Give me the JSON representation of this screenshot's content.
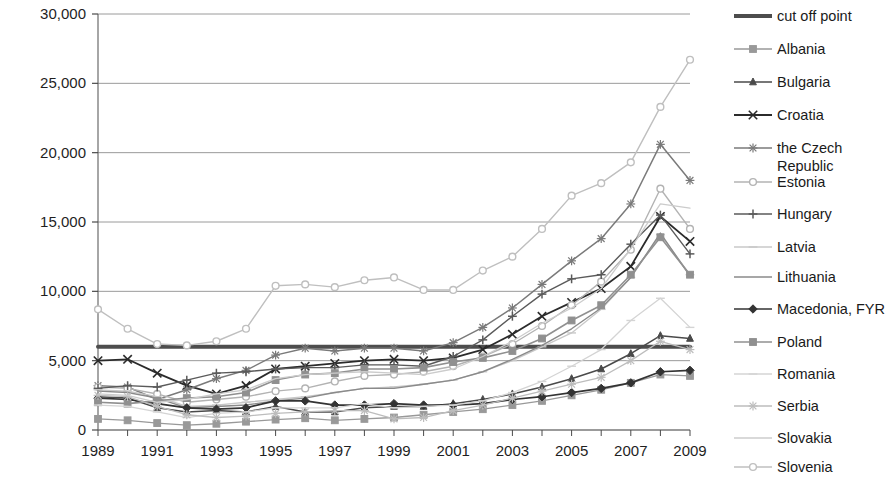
{
  "chart_data": {
    "type": "line",
    "title": "",
    "xlabel": "",
    "ylabel": "",
    "xlim": [
      1989,
      2009
    ],
    "ylim": [
      0,
      30000
    ],
    "ytick_values": [
      0,
      5000,
      10000,
      15000,
      20000,
      25000,
      30000
    ],
    "ytick_labels": [
      "0",
      "5,000",
      "10,000",
      "15,000",
      "20,000",
      "25,000",
      "30,000"
    ],
    "xtick_values": [
      1989,
      1991,
      1993,
      1995,
      1997,
      1999,
      2001,
      2003,
      2005,
      2007,
      2009
    ],
    "xtick_labels": [
      "1989",
      "1991",
      "1993",
      "1995",
      "1997",
      "1999",
      "2001",
      "2003",
      "2005",
      "2007",
      "2009"
    ],
    "x": [
      1989,
      1990,
      1991,
      1992,
      1993,
      1994,
      1995,
      1996,
      1997,
      1998,
      1999,
      2000,
      2001,
      2002,
      2003,
      2004,
      2005,
      2006,
      2007,
      2008,
      2009
    ],
    "grid": true,
    "legend_position": "right",
    "series": [
      {
        "name": "cut off point",
        "color": "#4d4d4d",
        "width": 4.0,
        "marker": "none",
        "values": [
          6000,
          6000,
          6000,
          6000,
          6000,
          6000,
          6000,
          6000,
          6000,
          6000,
          6000,
          6000,
          6000,
          6000,
          6000,
          6000,
          6000,
          6000,
          6000,
          6000,
          6000
        ]
      },
      {
        "name": "Albania",
        "color": "#999999",
        "width": 1.3,
        "marker": "square",
        "values": [
          800,
          700,
          500,
          350,
          450,
          600,
          750,
          850,
          700,
          800,
          900,
          1100,
          1300,
          1500,
          1800,
          2100,
          2500,
          2900,
          3400,
          4000,
          3900
        ]
      },
      {
        "name": "Bulgaria",
        "color": "#4a4a4a",
        "width": 1.5,
        "marker": "triangle",
        "values": [
          2400,
          2300,
          1600,
          1300,
          1400,
          1300,
          1700,
          1300,
          1300,
          1600,
          1700,
          1700,
          1900,
          2200,
          2600,
          3100,
          3700,
          4400,
          5500,
          6800,
          6600
        ]
      },
      {
        "name": "Croatia",
        "color": "#2b2b2b",
        "width": 1.8,
        "marker": "x",
        "values": [
          5000,
          5100,
          4100,
          3200,
          2600,
          3200,
          4400,
          4600,
          4800,
          5000,
          5100,
          5000,
          5200,
          5800,
          6900,
          8200,
          9200,
          10200,
          11800,
          15400,
          13600
        ]
      },
      {
        "name": "the Czech Republic",
        "color": "#7a7a7a",
        "width": 1.5,
        "marker": "star",
        "values": [
          3200,
          3100,
          2200,
          2900,
          3700,
          4300,
          5400,
          5900,
          5700,
          5900,
          5900,
          5700,
          6300,
          7400,
          8800,
          10500,
          12200,
          13800,
          16300,
          20600,
          18000
        ]
      },
      {
        "name": "Estonia",
        "color": "#b3b3b3",
        "width": 1.4,
        "marker": "circle",
        "values": [
          3100,
          3000,
          2600,
          2000,
          2200,
          2400,
          2800,
          3000,
          3500,
          3900,
          4000,
          4200,
          4600,
          5300,
          6200,
          7500,
          9000,
          10700,
          13000,
          17400,
          14500
        ]
      },
      {
        "name": "Hungary",
        "color": "#5a5a5a",
        "width": 1.4,
        "marker": "plus",
        "values": [
          3000,
          3200,
          3100,
          3600,
          4100,
          4200,
          4400,
          4500,
          4500,
          4700,
          4700,
          4600,
          5300,
          6500,
          8200,
          9800,
          10900,
          11200,
          13400,
          15500,
          12700
        ]
      },
      {
        "name": "Latvia",
        "color": "#c8c8c8",
        "width": 1.3,
        "marker": "dash",
        "values": [
          2900,
          2800,
          2400,
          1700,
          1800,
          2000,
          2200,
          2400,
          2700,
          3000,
          3100,
          3300,
          3600,
          4200,
          5000,
          6000,
          7000,
          8700,
          11000,
          14100,
          11200
        ]
      },
      {
        "name": "Lithuania",
        "color": "#8a8a8a",
        "width": 1.4,
        "marker": "none",
        "values": [
          2800,
          2700,
          2300,
          1600,
          1700,
          1800,
          2100,
          2300,
          2700,
          3000,
          3000,
          3300,
          3600,
          4200,
          5100,
          6100,
          7300,
          8800,
          11000,
          14200,
          11100
        ]
      },
      {
        "name": "Macedonia, FYR",
        "color": "#333333",
        "width": 1.7,
        "marker": "diamond",
        "values": [
          2300,
          2200,
          1900,
          1600,
          1500,
          1600,
          2100,
          2100,
          1800,
          1800,
          1900,
          1800,
          1800,
          1900,
          2200,
          2400,
          2700,
          3000,
          3400,
          4200,
          4300
        ]
      },
      {
        "name": "Poland",
        "color": "#909090",
        "width": 1.6,
        "marker": "square",
        "values": [
          2000,
          1900,
          2100,
          2300,
          2400,
          2700,
          3600,
          4000,
          4100,
          4400,
          4400,
          4500,
          4900,
          5200,
          5700,
          6600,
          7900,
          9000,
          11200,
          13900,
          11200
        ]
      },
      {
        "name": "Romania",
        "color": "#d4d4d4",
        "width": 1.3,
        "marker": "dash",
        "values": [
          1800,
          1700,
          1300,
          900,
          1200,
          1300,
          1600,
          1600,
          1600,
          1900,
          1600,
          1700,
          1800,
          2100,
          2700,
          3500,
          4600,
          5800,
          7900,
          9500,
          7400
        ]
      },
      {
        "name": "Serbia",
        "color": "#bdbdbd",
        "width": 1.3,
        "marker": "star",
        "values": [
          2500,
          2400,
          1700,
          1100,
          900,
          1000,
          1200,
          1300,
          1400,
          1400,
          800,
          900,
          1400,
          1800,
          2300,
          2800,
          3300,
          3800,
          5000,
          6400,
          5800
        ]
      },
      {
        "name": "Slovakia",
        "color": "#cccccc",
        "width": 1.3,
        "marker": "none",
        "values": [
          2600,
          2500,
          2000,
          2200,
          2600,
          2900,
          3700,
          4000,
          4100,
          4200,
          4100,
          4000,
          4400,
          5300,
          6400,
          7700,
          8800,
          10200,
          13100,
          16300,
          16000
        ]
      },
      {
        "name": "Slovenia",
        "color": "#bfbfbf",
        "width": 1.4,
        "marker": "circle",
        "values": [
          8700,
          7300,
          6200,
          6100,
          6400,
          7300,
          10400,
          10500,
          10300,
          10800,
          11000,
          10100,
          10100,
          11500,
          12500,
          14500,
          16900,
          17800,
          19300,
          23300,
          26700
        ]
      }
    ],
    "series_note_slovenia_tail": [
      23300,
      26700,
      23500
    ]
  },
  "legend": {
    "entries": [
      {
        "label": "cut off point"
      },
      {
        "label": "Albania"
      },
      {
        "label": "Bulgaria"
      },
      {
        "label": "Croatia"
      },
      {
        "label": "the Czech"
      },
      {
        "label": "Republic"
      },
      {
        "label": "Estonia"
      },
      {
        "label": "Hungary"
      },
      {
        "label": "Latvia"
      },
      {
        "label": "Lithuania"
      },
      {
        "label": "Macedonia, FYR"
      },
      {
        "label": "Poland"
      },
      {
        "label": "Romania"
      },
      {
        "label": "Serbia"
      },
      {
        "label": "Slovakia"
      },
      {
        "label": "Slovenia"
      }
    ]
  }
}
